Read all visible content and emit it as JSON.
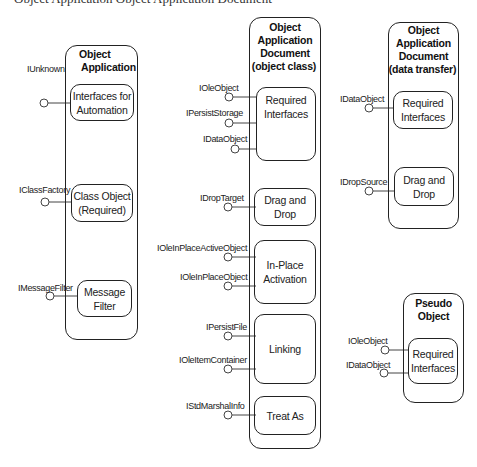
{
  "header_cutoff": "Object Application  Object Application Document",
  "components": {
    "object_application": {
      "title": "Object\nApplication",
      "title_line1": "Object",
      "title_line2": "Application",
      "inner": [
        {
          "label": "Interfaces for\nAutomation",
          "interfaces": [
            "IUnknown"
          ]
        },
        {
          "label": "Class Object\n(Required)",
          "interfaces": [
            "IClassFactory"
          ]
        },
        {
          "label": "Message\nFilter",
          "interfaces": [
            "IMessageFilter"
          ]
        }
      ]
    },
    "document_object_class": {
      "title_line1": "Object",
      "title_line2": "Application",
      "title_line3": "Document",
      "title_line4": "(object class)",
      "inner": [
        {
          "label": "Required\nInterfaces",
          "interfaces": [
            "IOleObject",
            "IPersistStorage",
            "IDataObject"
          ]
        },
        {
          "label": "Drag and\nDrop",
          "interfaces": [
            "IDropTarget"
          ]
        },
        {
          "label": "In-Place\nActivation",
          "interfaces": [
            "IOleInPlaceActiveObject",
            "IOleInPlaceObject"
          ]
        },
        {
          "label": "Linking",
          "interfaces": [
            "IPersistFile",
            "IOleItemContainer"
          ]
        },
        {
          "label": "Treat As",
          "interfaces": [
            "IStdMarshalInfo"
          ]
        }
      ]
    },
    "document_data_transfer": {
      "title_line1": "Object",
      "title_line2": "Application",
      "title_line3": "Document",
      "title_line4": "(data transfer)",
      "inner": [
        {
          "label": "Required\nInterfaces",
          "interfaces": [
            "IDataObject"
          ]
        },
        {
          "label": "Drag and\nDrop",
          "interfaces": [
            "IDropSource"
          ]
        }
      ]
    },
    "pseudo_object": {
      "title_line1": "Pseudo",
      "title_line2": "Object",
      "inner": [
        {
          "label": "Required\nInterfaces",
          "interfaces": [
            "IOleObject",
            "IDataObject"
          ]
        }
      ]
    }
  },
  "colors": {
    "stroke": "#222222",
    "background": "#ffffff",
    "text": "#1a1a1a"
  }
}
